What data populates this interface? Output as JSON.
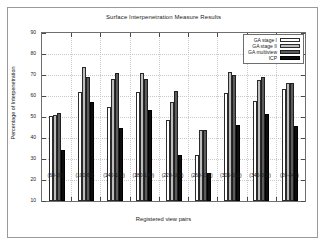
{
  "chart_data": {
    "type": "bar",
    "title": "Surface Interpenetration Measure Results",
    "xlabel": "Registered view pairs",
    "ylabel": "Percentage of Interpenetration",
    "ylim": [
      10,
      90
    ],
    "yticks": [
      10,
      20,
      30,
      40,
      50,
      60,
      70,
      80,
      90
    ],
    "grid": true,
    "legend_position": "top-right",
    "categories": [
      "(60-20)",
      "(100-60)",
      "(140-100)",
      "(180-140)",
      "(220-180)",
      "(260-220)",
      "(300-260)",
      "(340-300)",
      "(20-340)"
    ],
    "series": [
      {
        "name": "GA stage I",
        "values": [
          50.4,
          61.8,
          54.7,
          61.9,
          48.7,
          31.7,
          61.3,
          57.6,
          63.5
        ]
      },
      {
        "name": "GA stage II",
        "values": [
          50.8,
          73.8,
          68.0,
          71.0,
          57.2,
          43.6,
          71.2,
          67.7,
          66.3
        ]
      },
      {
        "name": "GA multiview",
        "values": [
          52.0,
          69.2,
          70.9,
          67.9,
          62.2,
          43.7,
          69.9,
          69.1,
          66.2
        ]
      },
      {
        "name": "ICP",
        "values": [
          34.3,
          57.3,
          44.8,
          53.5,
          31.8,
          23.4,
          46.0,
          51.2,
          45.6
        ]
      }
    ]
  },
  "legend": {
    "entries": [
      "GA stage I",
      "GA stage II",
      "GA multiview",
      "ICP"
    ]
  }
}
